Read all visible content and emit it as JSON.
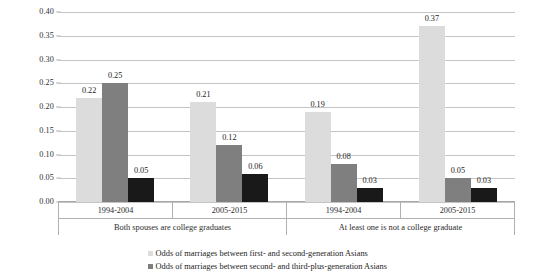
{
  "chart_data": {
    "type": "bar",
    "title": "",
    "xlabel": "",
    "ylabel": "",
    "ylim": [
      0,
      0.4
    ],
    "ytick_step": 0.05,
    "yticks": [
      "0.40",
      "0.35",
      "0.30",
      "0.25",
      "0.20",
      "0.15",
      "0.10",
      "0.05",
      "0.00"
    ],
    "grid": "horizontal",
    "legend_position": "bottom",
    "categories": [
      "1994-2004",
      "2005-2015",
      "1994-2004",
      "2005-2015"
    ],
    "group_labels": [
      "Both spouses are college graduates",
      "At least one is not a college graduate"
    ],
    "series": [
      {
        "name": "Odds of marriages between first- and second-generation Asians",
        "color": "#dcdcdc",
        "values": [
          0.22,
          0.21,
          0.19,
          0.37
        ],
        "labels": [
          "0.22",
          "0.21",
          "0.19",
          "0.37"
        ]
      },
      {
        "name": "Odds of marriages between second- and third-plus-generation Asians",
        "color": "#7f7f7f",
        "values": [
          0.25,
          0.12,
          0.08,
          0.05
        ],
        "labels": [
          "0.25",
          "0.12",
          "0.08",
          "0.05"
        ]
      },
      {
        "name": "",
        "color": "#191919",
        "values": [
          0.05,
          0.06,
          0.03,
          0.03
        ],
        "labels": [
          "0.05",
          "0.06",
          "0.03",
          "0.03"
        ]
      }
    ]
  },
  "legend": {
    "items": [
      {
        "label": "Odds of marriages between first- and second-generation Asians",
        "color": "#dcdcdc"
      },
      {
        "label": "Odds of marriages between second- and third-plus-generation Asians",
        "color": "#7f7f7f"
      }
    ]
  }
}
